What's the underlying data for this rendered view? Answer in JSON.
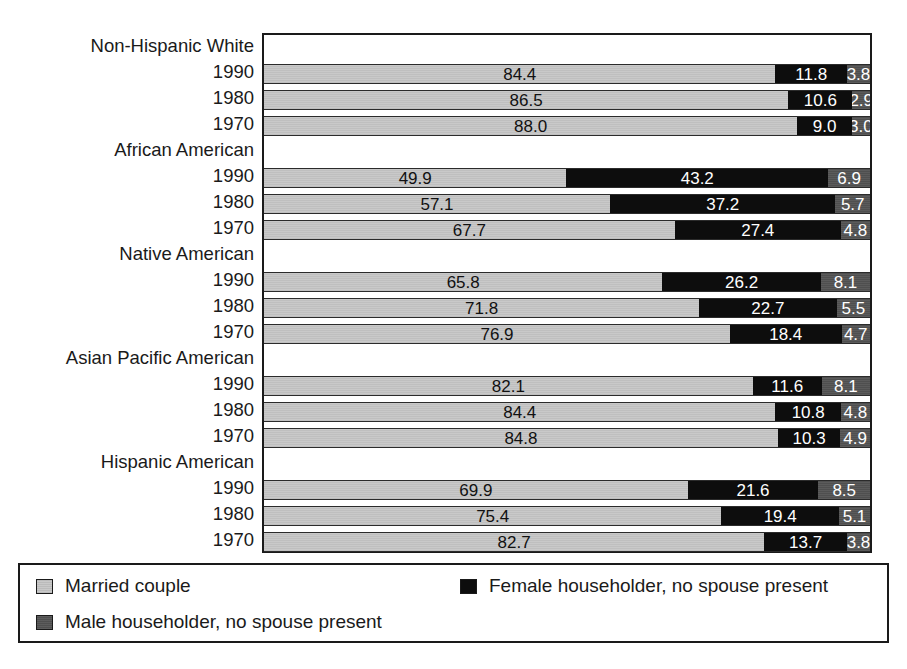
{
  "chart_data": {
    "type": "bar",
    "subtype": "stacked-horizontal-percent",
    "title": "",
    "xlabel": "",
    "ylabel": "",
    "xlim": [
      0,
      100
    ],
    "grid": false,
    "legend_position": "bottom",
    "series": [
      {
        "name": "Married couple",
        "key": "married",
        "color": "#c9c9c9"
      },
      {
        "name": "Female householder, no spouse present",
        "key": "female",
        "color": "#0d0d0d"
      },
      {
        "name": "Male householder, no spouse present",
        "key": "male",
        "color": "#4f4f4f"
      }
    ],
    "groups": [
      {
        "label": "Non-Hispanic White",
        "rows": [
          {
            "label": "1990",
            "married": 84.4,
            "female": 11.8,
            "male": 3.8
          },
          {
            "label": "1980",
            "married": 86.5,
            "female": 10.6,
            "male": 2.9
          },
          {
            "label": "1970",
            "married": 88.0,
            "female": 9.0,
            "male": 3.0
          }
        ]
      },
      {
        "label": "African American",
        "rows": [
          {
            "label": "1990",
            "married": 49.9,
            "female": 43.2,
            "male": 6.9
          },
          {
            "label": "1980",
            "married": 57.1,
            "female": 37.2,
            "male": 5.7
          },
          {
            "label": "1970",
            "married": 67.7,
            "female": 27.4,
            "male": 4.8
          }
        ]
      },
      {
        "label": "Native American",
        "rows": [
          {
            "label": "1990",
            "married": 65.8,
            "female": 26.2,
            "male": 8.1
          },
          {
            "label": "1980",
            "married": 71.8,
            "female": 22.7,
            "male": 5.5
          },
          {
            "label": "1970",
            "married": 76.9,
            "female": 18.4,
            "male": 4.7
          }
        ]
      },
      {
        "label": "Asian Pacific American",
        "rows": [
          {
            "label": "1990",
            "married": 82.1,
            "female": 11.6,
            "male": 8.1
          },
          {
            "label": "1980",
            "married": 84.4,
            "female": 10.8,
            "male": 4.8
          },
          {
            "label": "1970",
            "married": 84.8,
            "female": 10.3,
            "male": 4.9
          }
        ]
      },
      {
        "label": "Hispanic American",
        "rows": [
          {
            "label": "1990",
            "married": 69.9,
            "female": 21.6,
            "male": 8.5
          },
          {
            "label": "1980",
            "married": 75.4,
            "female": 19.4,
            "male": 5.1
          },
          {
            "label": "1970",
            "married": 82.7,
            "female": 13.7,
            "male": 3.8
          }
        ]
      }
    ]
  },
  "legend": {
    "items": [
      {
        "label": "Married couple",
        "swatch": "married-couple-swatch"
      },
      {
        "label": "Female householder, no spouse present",
        "swatch": "female-householder-swatch"
      },
      {
        "label": "Male householder, no spouse present",
        "swatch": "male-householder-swatch"
      }
    ]
  }
}
